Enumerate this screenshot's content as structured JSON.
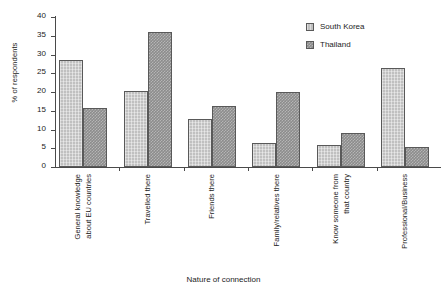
{
  "chart_data": {
    "type": "bar",
    "title": "",
    "xlabel": "Nature of connection",
    "ylabel": "% of respondents",
    "ylim": [
      0,
      40
    ],
    "yticks": [
      0,
      5,
      10,
      15,
      20,
      25,
      30,
      35,
      40
    ],
    "grid": false,
    "legend_position": "top-right",
    "categories": [
      "General knowledge about EU countries",
      "Travelled there",
      "Friends there",
      "Family/relatives there",
      "Know someone from that country",
      "Professional/Business"
    ],
    "category_lines": [
      [
        "General knowledge",
        "about EU countries"
      ],
      [
        "Travelled there"
      ],
      [
        "Friends there"
      ],
      [
        "Family/relatives there"
      ],
      [
        "Know someone from",
        "that country"
      ],
      [
        "Professional/Business"
      ]
    ],
    "series": [
      {
        "name": "South Korea",
        "color": "#c0c0c0",
        "values": [
          28.5,
          20.3,
          12.8,
          6.5,
          5.8,
          26.3
        ]
      },
      {
        "name": "Thailand",
        "color": "#8c8c8c",
        "values": [
          15.8,
          36.0,
          16.2,
          20.0,
          9.0,
          5.3
        ]
      }
    ]
  },
  "legend": {
    "items": [
      {
        "label": "South Korea"
      },
      {
        "label": "Thailand"
      }
    ]
  },
  "axes": {
    "y_title": "% of respondents",
    "x_title": "Nature of connection",
    "y_tick_labels": [
      "0",
      "5",
      "10",
      "15",
      "20",
      "25",
      "30",
      "35",
      "40"
    ]
  },
  "colors": {
    "series_south_korea": "#c0c0c0",
    "series_thailand": "#8c8c8c",
    "axis": "#4a4a4a",
    "text": "#1c1c1c",
    "background": "#ffffff"
  }
}
